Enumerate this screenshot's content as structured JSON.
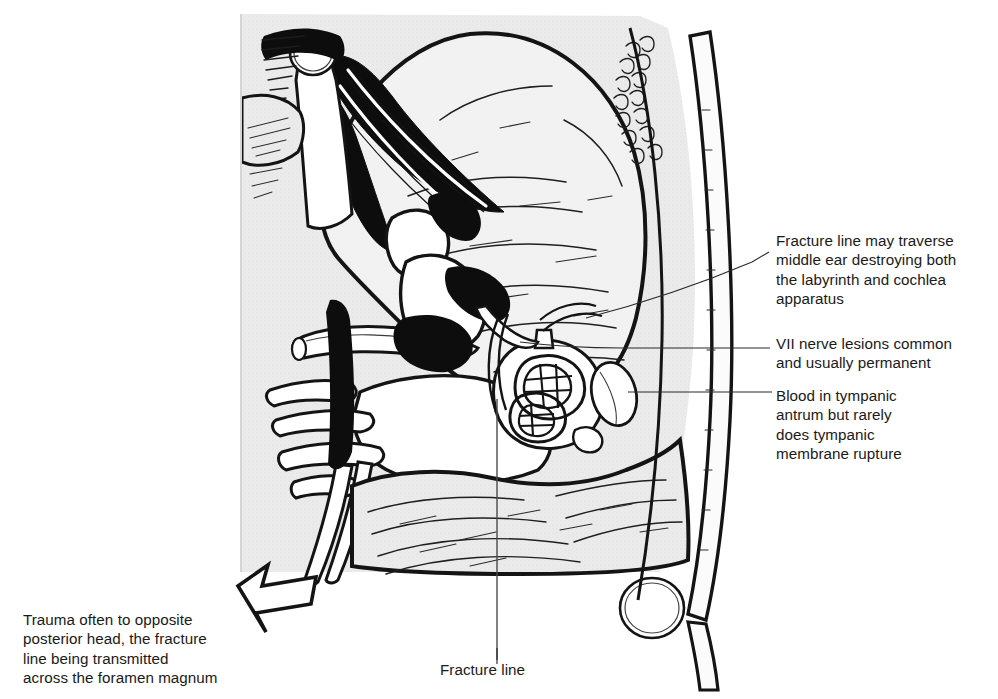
{
  "figure": {
    "kind": "anatomical-line-drawing",
    "background_color": "#ffffff",
    "ink_color": "#141414",
    "tissue_fill_color": "#e9e9e9",
    "bone_fill_color": "#f5f5f5",
    "text_color": "#1a1a1a"
  },
  "annotations": {
    "fracture_traverse": "Fracture line may traverse\nmiddle ear destroying both\nthe labyrinth and cochlea\napparatus",
    "vii_nerve": "VII nerve lesions common\nand usually permanent",
    "blood_tympanic": "Blood in tympanic\nantrum but rarely\ndoes tympanic\nmembrane rupture",
    "trauma_opposite": "Trauma often to opposite\nposterior head, the fracture\nline being transmitted\nacross the foramen magnum",
    "fracture_line": "Fracture line"
  },
  "structures": {
    "cochlea": "cochlea-and-labyrinth",
    "tympanic_membrane": "tympanic-membrane",
    "facial_nerve": "vii-facial-nerve",
    "cranial_nerves": "cranial-nerve-bundle",
    "skull_outer_table": "skull-outer-table",
    "scalp": "scalp-layer",
    "foramen_magnum_arrow": "impact-direction-arrow",
    "internal_carotid": "internal-carotid-artery",
    "brain_mass": "cerebral-hemisphere",
    "cerebellum": "cerebellum",
    "jugular_bulb": "jugular-bulb"
  }
}
